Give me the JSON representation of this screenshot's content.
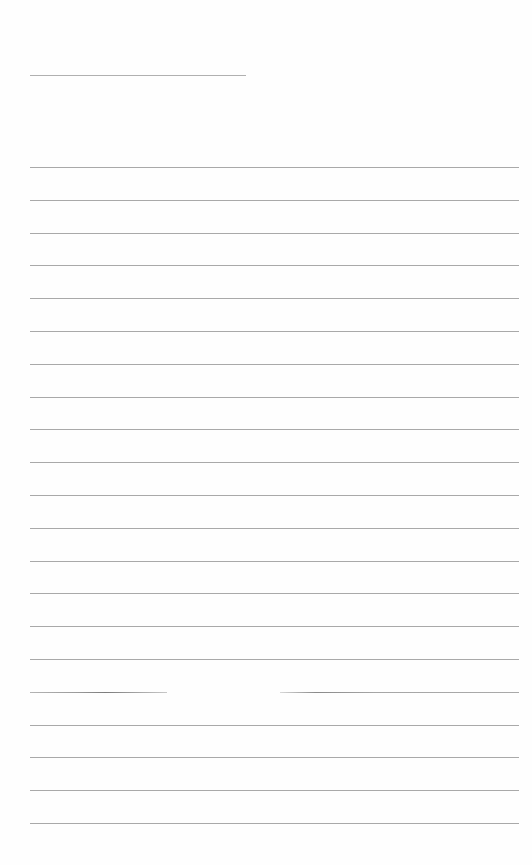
{
  "document": {
    "type": "lined-paper",
    "background": "#fefefe",
    "line_color": "#a9a9a9",
    "header_line": {
      "x": 30,
      "y": 75,
      "width": 216
    },
    "ruled_lines": {
      "x": 30,
      "width": 489,
      "start_y": 167,
      "spacing": 32.8,
      "count": 21
    },
    "broken_line": {
      "index": 16,
      "segments": [
        {
          "x": 30,
          "width": 137
        },
        {
          "x": 280,
          "width": 239
        }
      ]
    }
  }
}
